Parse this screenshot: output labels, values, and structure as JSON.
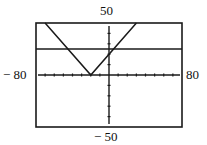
{
  "chart_data": {
    "type": "line",
    "title": "",
    "xlabel": "",
    "ylabel": "",
    "xlim": [
      -80,
      80
    ],
    "ylim": [
      -50,
      50
    ],
    "xscale": 10,
    "yscale": 10,
    "grid": false,
    "window_labels": {
      "xmin": "− 80",
      "xmax": "80",
      "ymin": "− 50",
      "ymax": "50"
    },
    "series": [
      {
        "name": "y = |x + 20|",
        "kind": "absolute-value",
        "vertex": [
          -20,
          0
        ],
        "points": [
          [
            -70,
            50
          ],
          [
            -20,
            0
          ],
          [
            30,
            50
          ]
        ]
      },
      {
        "name": "y = 25",
        "kind": "horizontal-line",
        "points": [
          [
            -80,
            25
          ],
          [
            80,
            25
          ]
        ]
      }
    ],
    "intersections": [
      [
        -45,
        25
      ],
      [
        5,
        25
      ]
    ]
  },
  "frame": {
    "x0": 36,
    "y0": 23,
    "x1": 182,
    "y1": 127
  },
  "colors": {
    "ink": "#1a1a1a",
    "background": "#ffffff"
  }
}
